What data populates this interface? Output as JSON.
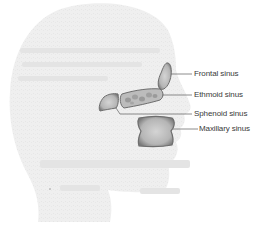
{
  "diagram": {
    "colors": {
      "head_fill": "#efefef",
      "sinus_fill": "#b8b8b8",
      "sinus_stroke": "#6e6e6e",
      "leader_line": "#707070",
      "label_text": "#3a3a3a"
    },
    "labels": {
      "frontal": "Frontal sinus",
      "ethmoid": "Ethmoid sinus",
      "sphenoid": "Sphenoid sinus",
      "maxillary": "Maxillary sinus"
    }
  }
}
